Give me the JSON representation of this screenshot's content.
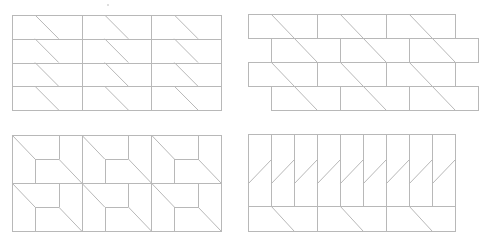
{
  "figure": {
    "stroke_color": "#b8b8b8",
    "background": "#ffffff",
    "panels": [
      {
        "id": "top-left",
        "type": "grid-with-diagonals",
        "frame": {
          "x": 12,
          "y": 15,
          "w": 209,
          "h": 95
        },
        "cols": 3,
        "rows": 4
      },
      {
        "id": "top-right",
        "type": "staggered-bricks-with-diagonals",
        "rows_y": [
          14,
          38,
          62,
          86,
          110
        ],
        "even_row": {
          "x0": 248,
          "x1": 455,
          "breaks": [
            317,
            386
          ]
        },
        "odd_row": {
          "x0": 271,
          "x1": 478,
          "breaks": [
            340,
            409
          ]
        }
      },
      {
        "id": "bottom-left",
        "type": "pinwheel-blocks",
        "frame": {
          "x": 12,
          "y": 135,
          "w": 209,
          "h": 96
        },
        "cols": 3,
        "rows": 2
      },
      {
        "id": "bottom-right",
        "type": "slatted-band",
        "frame": {
          "x": 248,
          "y": 134,
          "w": 207,
          "h": 97
        },
        "split_y": 206,
        "slats": 9,
        "lower_cells": 3
      }
    ]
  }
}
